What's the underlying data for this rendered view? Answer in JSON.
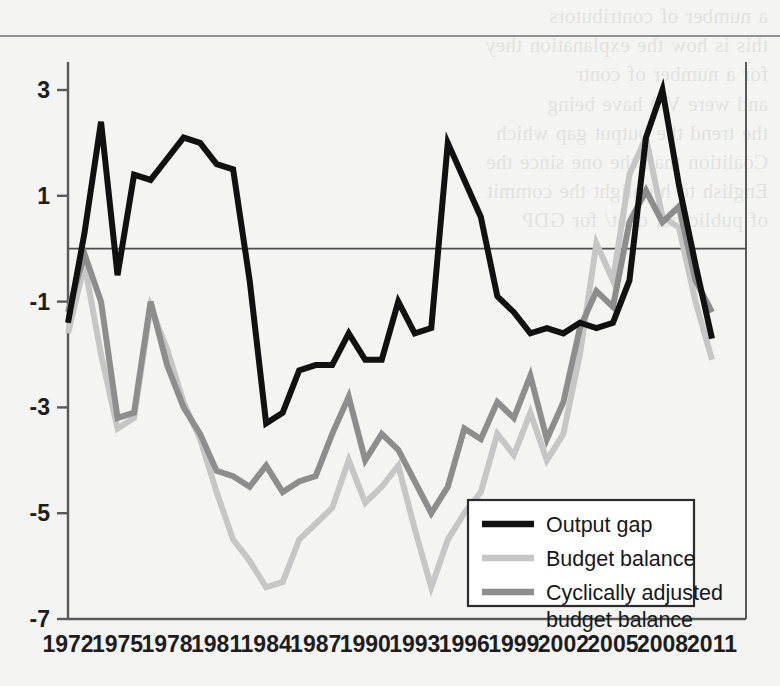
{
  "figure": {
    "background_color": "#f4f4f2",
    "plot_frame_color": "#57595b",
    "zero_line_color": "#4c4e50"
  },
  "bleed_through_text": "a number of contributors\nthis is how the explanation they\nfor a number of contr\nand were VO have being\nthe trend the output gap which\nCoalition than the one since the\nEnglish to highlight the commit\nof public net debt/ for GDP",
  "legend": {
    "entries": [
      {
        "label": "Output gap",
        "color": "#111111",
        "width": 6.5
      },
      {
        "label": "Budget balance",
        "color": "#c6c6c6",
        "width": 6.5
      },
      {
        "label": "Cyclically adjusted budget balance",
        "color": "#8d8d8d",
        "width": 6.5
      }
    ],
    "box": {
      "x": 468,
      "y": 500,
      "width": 226,
      "height": 106
    }
  },
  "chart_data": {
    "type": "line",
    "title": "",
    "subtitle": "",
    "xlabel": "",
    "ylabel": "",
    "grid": false,
    "legend_position": "inside-lower-right",
    "xlim": [
      1972,
      2011
    ],
    "ylim": [
      -7,
      3.4
    ],
    "yticks": [
      3,
      1,
      -1,
      -3,
      -5,
      -7
    ],
    "ytick_labels": [
      "3",
      "1",
      "-1",
      "-3",
      "-5",
      "-7"
    ],
    "xticks": [
      1972,
      1975,
      1978,
      1981,
      1984,
      1987,
      1990,
      1993,
      1996,
      1999,
      2002,
      2005,
      2008,
      2011
    ],
    "xtick_labels": [
      "1972",
      "1975",
      "1978",
      "1981",
      "1984",
      "1987",
      "1990",
      "1993",
      "1996",
      "1999",
      "2002",
      "2005",
      "2008",
      "2011"
    ],
    "x": [
      1972,
      1973,
      1974,
      1975,
      1976,
      1977,
      1978,
      1979,
      1980,
      1981,
      1982,
      1983,
      1984,
      1985,
      1986,
      1987,
      1988,
      1989,
      1990,
      1991,
      1992,
      1993,
      1994,
      1995,
      1996,
      1997,
      1998,
      1999,
      2000,
      2001,
      2002,
      2003,
      2004,
      2005,
      2006,
      2007,
      2008,
      2009,
      2010,
      2011
    ],
    "series": [
      {
        "name": "Output gap",
        "color": "#111111",
        "linewidth": 6.0,
        "values": [
          -1.4,
          0.3,
          2.4,
          -0.5,
          1.4,
          1.3,
          1.7,
          2.1,
          2.0,
          1.6,
          1.5,
          -0.6,
          -3.3,
          -3.1,
          -2.3,
          -2.2,
          -2.2,
          -1.6,
          -2.1,
          -2.1,
          -1.0,
          -1.6,
          -1.5,
          2.0,
          1.3,
          0.6,
          -0.9,
          -1.2,
          -1.6,
          -1.5,
          -1.6,
          -1.4,
          -1.5,
          -1.4,
          -0.6,
          2.1,
          3.0,
          1.2,
          -0.3,
          -1.7
        ]
      },
      {
        "name": "Budget balance",
        "color": "#c6c6c6",
        "linewidth": 6.0,
        "values": [
          -1.6,
          -0.3,
          -2.0,
          -3.4,
          -3.2,
          -1.1,
          -1.9,
          -2.9,
          -3.6,
          -4.6,
          -5.5,
          -5.9,
          -6.4,
          -6.3,
          -5.5,
          -5.2,
          -4.9,
          -4.0,
          -4.8,
          -4.5,
          -4.1,
          -5.3,
          -6.4,
          -5.5,
          -5.0,
          -4.6,
          -3.5,
          -3.9,
          -3.1,
          -4.0,
          -3.5,
          -2.0,
          0.1,
          -0.6,
          1.4,
          2.1,
          0.6,
          0.4,
          -1.0,
          -2.1
        ]
      },
      {
        "name": "Cyclically adjusted budget balance",
        "color": "#8d8d8d",
        "linewidth": 6.0,
        "values": [
          -1.2,
          -0.1,
          -1.0,
          -3.2,
          -3.1,
          -1.0,
          -2.2,
          -3.0,
          -3.5,
          -4.2,
          -4.3,
          -4.5,
          -4.1,
          -4.6,
          -4.4,
          -4.3,
          -3.5,
          -2.8,
          -4.0,
          -3.5,
          -3.8,
          -4.4,
          -5.0,
          -4.5,
          -3.4,
          -3.6,
          -2.9,
          -3.2,
          -2.4,
          -3.6,
          -2.9,
          -1.5,
          -0.8,
          -1.1,
          0.5,
          1.1,
          0.5,
          0.8,
          -0.6,
          -1.2
        ]
      }
    ]
  },
  "series_values_rebased": {
    "note_hint": "values in percent of GDP / percent of potential output"
  }
}
